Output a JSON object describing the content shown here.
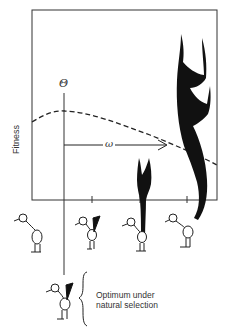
{
  "diagram": {
    "type": "sexual-selection-fitness-diagram",
    "y_axis_label": "Fitness",
    "optimum_symbol": "Θ",
    "distance_symbol": "ω",
    "annotation_line1": "Optimum under",
    "annotation_line2": "natural selection",
    "fitness_curve": "dashed",
    "birds": [
      {
        "position": "left",
        "tail": "none"
      },
      {
        "position": "optimum-marker",
        "tail": "small-triangle"
      },
      {
        "position": "middle",
        "tail": "medium-forked"
      },
      {
        "position": "right",
        "tail": "large-ornate"
      },
      {
        "position": "below-optimum",
        "tail": "small-triangle"
      }
    ],
    "colors": {
      "ink": "#111111",
      "frame": "#333333",
      "background": "#ffffff"
    }
  }
}
